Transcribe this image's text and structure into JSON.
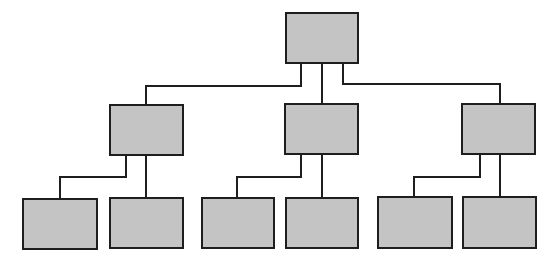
{
  "diagram": {
    "type": "org-chart-tree",
    "colors": {
      "background": "#ffffff",
      "box_fill": "#c4c4c4",
      "stroke": "#1e1e1e"
    },
    "nodes": [
      {
        "id": "root",
        "level": 0,
        "x": 286,
        "y": 13,
        "w": 72,
        "h": 50,
        "label": ""
      },
      {
        "id": "mid-left",
        "level": 1,
        "x": 110,
        "y": 105,
        "w": 73,
        "h": 50,
        "label": ""
      },
      {
        "id": "mid-center",
        "level": 1,
        "x": 285,
        "y": 104,
        "w": 73,
        "h": 50,
        "label": ""
      },
      {
        "id": "mid-right",
        "level": 1,
        "x": 462,
        "y": 104,
        "w": 73,
        "h": 50,
        "label": ""
      },
      {
        "id": "leaf-1",
        "level": 2,
        "x": 23,
        "y": 199,
        "w": 74,
        "h": 50,
        "label": ""
      },
      {
        "id": "leaf-2",
        "level": 2,
        "x": 110,
        "y": 198,
        "w": 73,
        "h": 50,
        "label": ""
      },
      {
        "id": "leaf-3",
        "level": 2,
        "x": 202,
        "y": 198,
        "w": 72,
        "h": 50,
        "label": ""
      },
      {
        "id": "leaf-4",
        "level": 2,
        "x": 286,
        "y": 198,
        "w": 72,
        "h": 50,
        "label": ""
      },
      {
        "id": "leaf-5",
        "level": 2,
        "x": 378,
        "y": 197,
        "w": 74,
        "h": 51,
        "label": ""
      },
      {
        "id": "leaf-6",
        "level": 2,
        "x": 463,
        "y": 197,
        "w": 73,
        "h": 51,
        "label": ""
      }
    ],
    "edges": [
      {
        "from": "root",
        "to": "mid-left",
        "points": "301,63 301,86 146,86 146,105"
      },
      {
        "from": "root",
        "to": "mid-center",
        "points": "322,63 322,104"
      },
      {
        "from": "root",
        "to": "mid-right",
        "points": "343,63 343,84 500,84 500,104"
      },
      {
        "from": "mid-left",
        "to": "leaf-1",
        "points": "126,155 126,177 60,177 60,199"
      },
      {
        "from": "mid-left",
        "to": "leaf-2",
        "points": "146,155 146,198"
      },
      {
        "from": "mid-center",
        "to": "leaf-3",
        "points": "301,154 301,177 237,177 237,198"
      },
      {
        "from": "mid-center",
        "to": "leaf-4",
        "points": "322,154 322,198"
      },
      {
        "from": "mid-right",
        "to": "leaf-5",
        "points": "480,154 480,177 414,177 414,197"
      },
      {
        "from": "mid-right",
        "to": "leaf-6",
        "points": "500,154 500,197"
      }
    ]
  }
}
